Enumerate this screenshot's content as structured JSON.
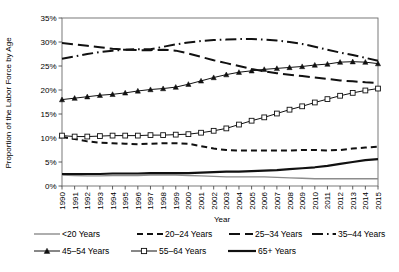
{
  "chart_data": {
    "type": "line",
    "title": "",
    "xlabel": "Year",
    "ylabel": "Proportion of the Labor Force by Age",
    "ylim": [
      0,
      35
    ],
    "yticks": [
      "0%",
      "5%",
      "10%",
      "15%",
      "20%",
      "25%",
      "30%",
      "35%"
    ],
    "ytick_values": [
      0,
      5,
      10,
      15,
      20,
      25,
      30,
      35
    ],
    "grid": false,
    "legend_position": "bottom",
    "categories": [
      "1990",
      "1991",
      "1992",
      "1993",
      "1994",
      "1995",
      "1996",
      "1997",
      "1998",
      "1999",
      "2000",
      "2001",
      "2002",
      "2003",
      "2004",
      "2005",
      "2006",
      "2007",
      "2008",
      "2009",
      "2010",
      "2011",
      "2012",
      "2013",
      "2014",
      "2015"
    ],
    "x": [
      1990,
      1991,
      1992,
      1993,
      1994,
      1995,
      1996,
      1997,
      1998,
      1999,
      2000,
      2001,
      2002,
      2003,
      2004,
      2005,
      2006,
      2007,
      2008,
      2009,
      2010,
      2011,
      2012,
      2013,
      2014,
      2015
    ],
    "series": [
      {
        "name": "<20 Years",
        "style": "solid-thin",
        "color": "#8c8c8c",
        "marker": "none",
        "values": [
          2.3,
          2.2,
          2.1,
          2.1,
          2.2,
          2.2,
          2.2,
          2.3,
          2.3,
          2.3,
          2.2,
          2.1,
          2.0,
          1.9,
          1.9,
          1.9,
          1.9,
          1.8,
          1.7,
          1.6,
          1.5,
          1.5,
          1.5,
          1.5,
          1.5,
          1.5
        ]
      },
      {
        "name": "20–24 Years",
        "style": "dashed",
        "color": "#111111",
        "marker": "none",
        "values": [
          10.2,
          9.8,
          9.3,
          9.0,
          8.9,
          8.8,
          8.7,
          8.8,
          8.9,
          8.9,
          8.8,
          8.3,
          7.8,
          7.5,
          7.4,
          7.4,
          7.4,
          7.4,
          7.4,
          7.5,
          7.5,
          7.4,
          7.5,
          7.8,
          8.0,
          8.2
        ]
      },
      {
        "name": "25–34 Years",
        "style": "long-dash",
        "color": "#111111",
        "marker": "none",
        "values": [
          29.8,
          29.5,
          29.2,
          28.9,
          28.6,
          28.4,
          28.3,
          28.3,
          28.4,
          28.2,
          27.6,
          26.9,
          26.2,
          25.6,
          25.0,
          24.4,
          23.9,
          23.5,
          23.2,
          22.9,
          22.6,
          22.3,
          22.0,
          21.8,
          21.6,
          21.5
        ]
      },
      {
        "name": "35–44 Years",
        "style": "dash-dot",
        "color": "#111111",
        "marker": "none",
        "values": [
          26.5,
          27.0,
          27.5,
          27.9,
          28.2,
          28.4,
          28.5,
          28.5,
          29.0,
          29.5,
          29.9,
          30.2,
          30.4,
          30.5,
          30.6,
          30.6,
          30.5,
          30.3,
          30.0,
          29.6,
          29.0,
          28.4,
          27.8,
          27.3,
          26.7,
          26.1
        ]
      },
      {
        "name": "45–54 Years",
        "style": "solid-marker",
        "color": "#111111",
        "marker": "triangle",
        "values": [
          18.0,
          18.3,
          18.6,
          18.9,
          19.1,
          19.4,
          19.8,
          20.1,
          20.3,
          20.6,
          21.2,
          21.9,
          22.6,
          23.2,
          23.7,
          24.0,
          24.3,
          24.5,
          24.7,
          24.9,
          25.2,
          25.4,
          25.8,
          25.9,
          25.8,
          25.5
        ]
      },
      {
        "name": "55–64 Years",
        "style": "solid-marker-open",
        "color": "#111111",
        "marker": "square",
        "values": [
          10.5,
          10.3,
          10.3,
          10.4,
          10.5,
          10.5,
          10.5,
          10.6,
          10.6,
          10.7,
          10.8,
          11.1,
          11.5,
          12.0,
          12.8,
          13.6,
          14.3,
          15.1,
          15.9,
          16.6,
          17.4,
          18.1,
          18.8,
          19.4,
          19.9,
          20.3
        ]
      },
      {
        "name": "65+ Years",
        "style": "solid-thick",
        "color": "#111111",
        "marker": "none",
        "values": [
          2.5,
          2.5,
          2.5,
          2.5,
          2.6,
          2.6,
          2.6,
          2.7,
          2.7,
          2.7,
          2.7,
          2.8,
          2.9,
          3.0,
          3.0,
          3.1,
          3.2,
          3.3,
          3.5,
          3.7,
          3.9,
          4.2,
          4.6,
          5.0,
          5.4,
          5.6
        ]
      }
    ]
  },
  "axes": {
    "y_title": "Proportion of the Labor Force by Age",
    "x_title": "Year"
  },
  "legend": {
    "items": [
      {
        "label": "<20 Years",
        "key": "lt20"
      },
      {
        "label": "20–24 Years",
        "key": "a2024"
      },
      {
        "label": "25–34 Years",
        "key": "a2534"
      },
      {
        "label": "35–44 Years",
        "key": "a3544"
      },
      {
        "label": "45–54 Years",
        "key": "a4554"
      },
      {
        "label": "55–64 Years",
        "key": "a5564"
      },
      {
        "label": "65+ Years",
        "key": "a65p"
      }
    ]
  },
  "colors": {
    "axis": "#4d4d4d",
    "plot_frame": "#6b6b6b",
    "series_dark": "#111111",
    "series_light": "#8c8c8c",
    "background": "#ffffff"
  }
}
